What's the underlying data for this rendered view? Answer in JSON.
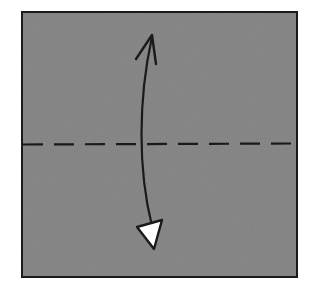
{
  "diagram": {
    "type": "origami-fold-step",
    "description": "Valley fold in half: fold bottom edge up to top edge along the horizontal dashed line, then unfold",
    "paper": {
      "color": "#808080",
      "border_color": "#1a1a1a",
      "x": 22,
      "y": 12,
      "width": 275,
      "height": 265
    },
    "fold_line": {
      "style": "dashed",
      "kind": "valley-fold",
      "y": 144,
      "color": "#1a1a1a"
    },
    "arrow": {
      "kind": "fold-and-unfold",
      "color": "#1a1a1a",
      "head_top": {
        "style": "open-chevron",
        "x": 152,
        "y": 35
      },
      "head_bottom": {
        "style": "hollow-triangle",
        "fill": "#ffffff",
        "x": 154,
        "y": 250
      }
    }
  }
}
